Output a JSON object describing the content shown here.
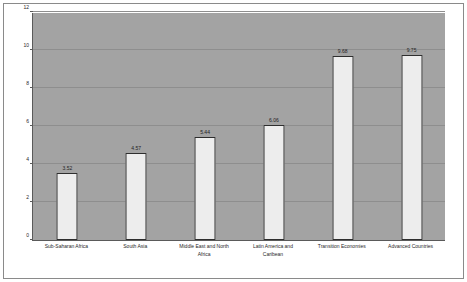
{
  "chart_data": {
    "type": "bar",
    "title": "",
    "subtitle": "",
    "xlabel": "",
    "ylabel": "",
    "ylim": [
      0,
      12
    ],
    "yticks": [
      0,
      2,
      4,
      6,
      8,
      10,
      12
    ],
    "ytick_labels": [
      "0",
      "2",
      "4",
      "6",
      "8",
      "10",
      "12"
    ],
    "grid": true,
    "legend": "none",
    "categories": [
      "Sub-Saharan Africa",
      "South Asia",
      "Middle East and North Africa",
      "Latin America and Caribean",
      "Transition Economies",
      "Advanced Countries"
    ],
    "category_lines": [
      [
        "Sub-Saharan Africa"
      ],
      [
        "South Asia"
      ],
      [
        "Middle East and North",
        "Africa"
      ],
      [
        "Latin America and",
        "Caribean"
      ],
      [
        "Transition Economies"
      ],
      [
        "Advanced Countries"
      ]
    ],
    "values": [
      3.52,
      4.57,
      5.44,
      6.06,
      9.68,
      9.75
    ],
    "value_labels": [
      "3.52",
      "4.57",
      "5.44",
      "6.06",
      "9.68",
      "9.75"
    ],
    "colors": {
      "bar_fill": "#ededed",
      "bar_edge": "#2e2e2e",
      "plot_background": "#a3a3a3",
      "gridline": "#8e8e8e",
      "axis": "#5a5a5a",
      "frame": "#8a8a8a",
      "text": "#1f1f1f",
      "figure_background": "#ffffff"
    }
  }
}
